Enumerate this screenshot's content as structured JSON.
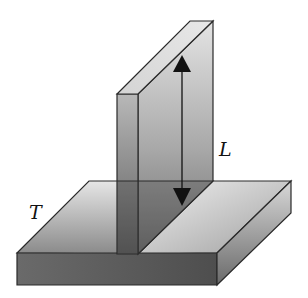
{
  "figure": {
    "labels": {
      "length": "L",
      "thickness": "T"
    },
    "arrow": {
      "type": "double-headed",
      "meaning": "length L along vertical plate"
    },
    "colors": {
      "outline": "#2a2a2a",
      "arrow": "#111111",
      "light_face": "#e8e8e8",
      "mid_face": "#b5b5b5",
      "dark_face": "#6e6e6e"
    }
  }
}
